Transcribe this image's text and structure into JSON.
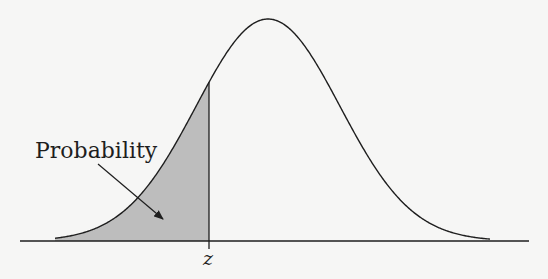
{
  "diagram": {
    "type": "normal-distribution-cdf",
    "shaded_region_label": "Probability",
    "z_label": "z",
    "colors": {
      "background": "#f6f6f5",
      "line": "#1e1e1e",
      "shade": "#bdbdbd"
    }
  },
  "chart_data": {
    "type": "area",
    "title": "",
    "xlabel": "",
    "ylabel": "",
    "curve": "standard normal density (bell curve)",
    "shaded": "area under curve to the left of z",
    "annotations": [
      {
        "text": "Probability",
        "points_to": "shaded area"
      },
      {
        "text": "z",
        "position": "x-axis, below vertical line at z"
      }
    ],
    "grid": false,
    "legend": false
  }
}
